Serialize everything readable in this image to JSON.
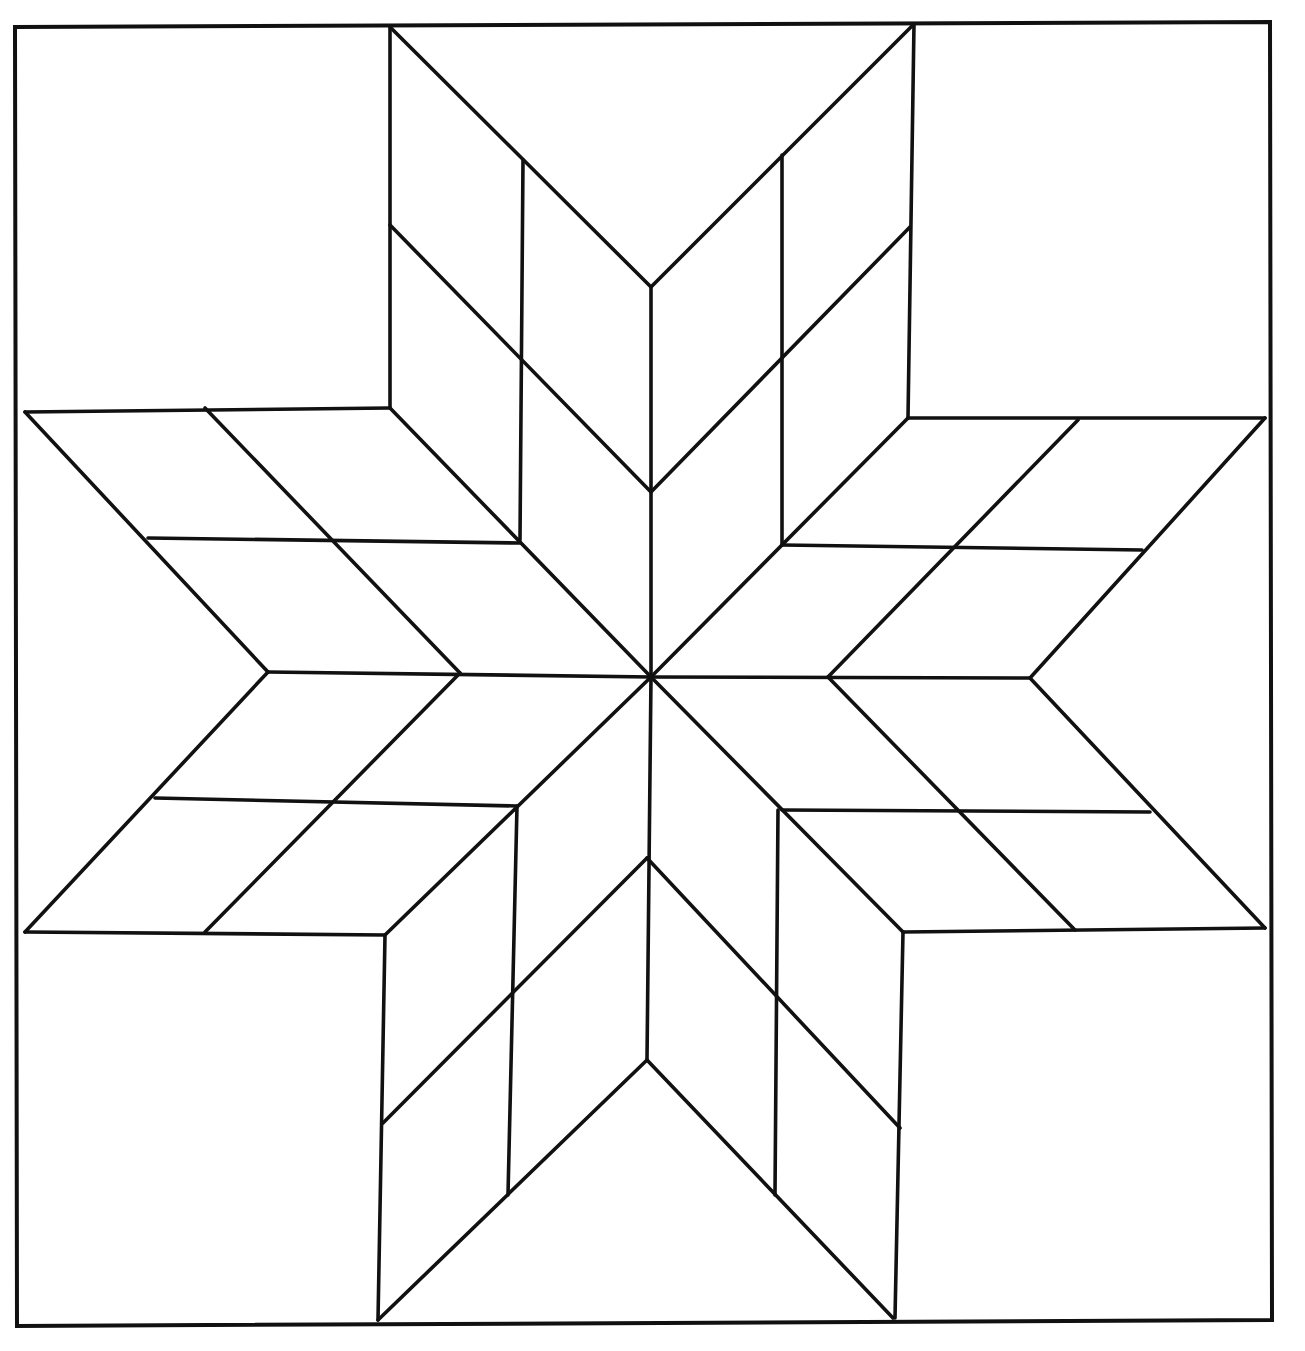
{
  "diagram": {
    "title": "Eight-pointed star (LeMoyne star) quilt block pattern",
    "colors": {
      "line": "#111111",
      "background": "#ffffff"
    },
    "frame": [
      [
        15,
        27
      ],
      [
        1270,
        22
      ],
      [
        1272,
        1320
      ],
      [
        17,
        1326
      ]
    ],
    "center": [
      651,
      677
    ],
    "segments": [
      [
        [
          390,
          27
        ],
        [
          390,
          408
        ]
      ],
      [
        [
          914,
          24
        ],
        [
          908,
          418
        ]
      ],
      [
        [
          390,
          27
        ],
        [
          651,
          287
        ]
      ],
      [
        [
          914,
          24
        ],
        [
          651,
          287
        ]
      ],
      [
        [
          523,
          160
        ],
        [
          520,
          540
        ]
      ],
      [
        [
          782,
          155
        ],
        [
          782,
          545
        ]
      ],
      [
        [
          651,
          287
        ],
        [
          651,
          677
        ]
      ],
      [
        [
          390,
          225
        ],
        [
          651,
          492
        ]
      ],
      [
        [
          910,
          227
        ],
        [
          651,
          492
        ]
      ],
      [
        [
          390,
          408
        ],
        [
          651,
          677
        ]
      ],
      [
        [
          908,
          418
        ],
        [
          651,
          677
        ]
      ],
      [
        [
          25,
          412
        ],
        [
          390,
          408
        ]
      ],
      [
        [
          25,
          412
        ],
        [
          268,
          672
        ]
      ],
      [
        [
          25,
          932
        ],
        [
          268,
          672
        ]
      ],
      [
        [
          148,
          538
        ],
        [
          520,
          543
        ]
      ],
      [
        [
          268,
          672
        ],
        [
          651,
          677
        ]
      ],
      [
        [
          155,
          798
        ],
        [
          517,
          806
        ]
      ],
      [
        [
          25,
          932
        ],
        [
          385,
          935
        ]
      ],
      [
        [
          205,
          408
        ],
        [
          460,
          673
        ]
      ],
      [
        [
          460,
          673
        ],
        [
          205,
          932
        ]
      ],
      [
        [
          651,
          677
        ],
        [
          385,
          935
        ]
      ],
      [
        [
          908,
          418
        ],
        [
          1265,
          418
        ]
      ],
      [
        [
          1265,
          418
        ],
        [
          1030,
          678
        ]
      ],
      [
        [
          1030,
          678
        ],
        [
          1265,
          928
        ]
      ],
      [
        [
          782,
          545
        ],
        [
          1142,
          550
        ]
      ],
      [
        [
          651,
          677
        ],
        [
          1030,
          678
        ]
      ],
      [
        [
          782,
          810
        ],
        [
          1150,
          812
        ]
      ],
      [
        [
          903,
          932
        ],
        [
          1265,
          928
        ]
      ],
      [
        [
          1078,
          420
        ],
        [
          828,
          677
        ]
      ],
      [
        [
          828,
          677
        ],
        [
          1075,
          930
        ]
      ],
      [
        [
          651,
          677
        ],
        [
          903,
          932
        ]
      ],
      [
        [
          385,
          935
        ],
        [
          378,
          1320
        ]
      ],
      [
        [
          903,
          932
        ],
        [
          895,
          1318
        ]
      ],
      [
        [
          517,
          806
        ],
        [
          508,
          1195
        ]
      ],
      [
        [
          778,
          810
        ],
        [
          775,
          1195
        ]
      ],
      [
        [
          651,
          677
        ],
        [
          647,
          1060
        ]
      ],
      [
        [
          383,
          1123
        ],
        [
          647,
          858
        ]
      ],
      [
        [
          647,
          858
        ],
        [
          900,
          1128
        ]
      ],
      [
        [
          378,
          1320
        ],
        [
          647,
          1060
        ]
      ],
      [
        [
          647,
          1060
        ],
        [
          893,
          1318
        ]
      ]
    ]
  }
}
